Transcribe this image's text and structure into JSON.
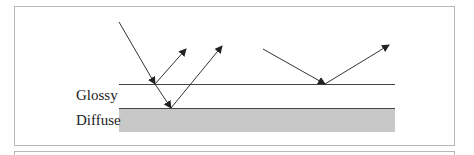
{
  "diagram": {
    "layers": [
      {
        "label": "Glossy",
        "type": "line"
      },
      {
        "label": "Diffuse",
        "type": "filled-box",
        "fill": "#c8c8c8"
      }
    ],
    "colors": {
      "frame": "#b8b8b8",
      "line": "#444444",
      "diffuse_fill": "#c8c8c8",
      "arrow": "#222222"
    }
  }
}
